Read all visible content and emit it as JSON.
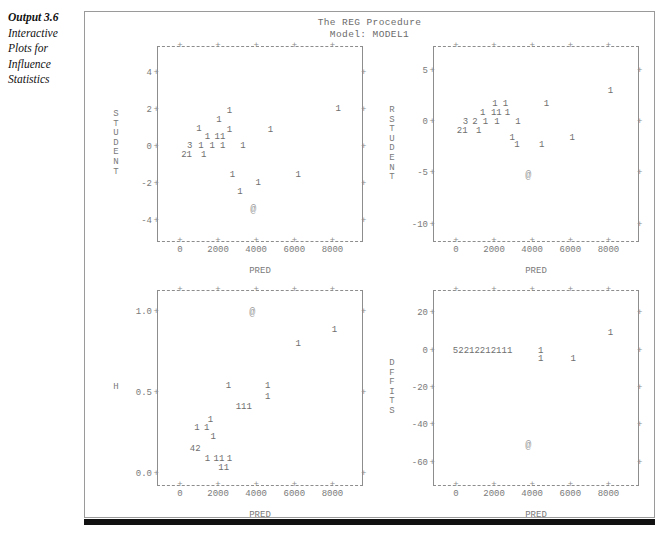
{
  "caption": {
    "strong": "Output 3.6",
    "lines": [
      "Interactive",
      "Plots for",
      "Influence",
      "Statistics"
    ]
  },
  "header": {
    "line1": "The REG Procedure",
    "line2": "Model: MODEL1"
  },
  "colors": {
    "ink": "#7a7a7a",
    "frame": "#8d8d8d",
    "rule": "#111111",
    "container_border": "#9a9a9a",
    "background": "#ffffff"
  },
  "glyphs": {
    "tick": "+",
    "marker": "@"
  },
  "chart_data": [
    {
      "type": "scatter",
      "name": "student-vs-pred",
      "title": "",
      "xlabel": "PRED",
      "ylabel": "STUDENT",
      "xlim": [
        -1200,
        9600
      ],
      "ylim": [
        -5.1,
        5.4
      ],
      "xticks": [
        0,
        2000,
        4000,
        6000,
        8000
      ],
      "yticks": [
        4,
        2,
        0,
        -2,
        -4
      ],
      "grid": false,
      "legend": "none",
      "points": [
        {
          "x": 8300,
          "y": 2.05,
          "label": "1"
        },
        {
          "x": 2600,
          "y": 1.95,
          "label": "1"
        },
        {
          "x": 2050,
          "y": 1.45,
          "label": "1"
        },
        {
          "x": 1000,
          "y": 0.95,
          "label": "1"
        },
        {
          "x": 2600,
          "y": 0.9,
          "label": "1"
        },
        {
          "x": 4750,
          "y": 0.9,
          "label": "1"
        },
        {
          "x": 1450,
          "y": 0.52,
          "label": "1"
        },
        {
          "x": 2100,
          "y": 0.52,
          "label": "11"
        },
        {
          "x": 520,
          "y": 0.03,
          "label": "3"
        },
        {
          "x": 1100,
          "y": 0.03,
          "label": "1"
        },
        {
          "x": 1700,
          "y": 0.03,
          "label": "1"
        },
        {
          "x": 2250,
          "y": 0.03,
          "label": "1"
        },
        {
          "x": 3300,
          "y": 0.03,
          "label": "1"
        },
        {
          "x": 350,
          "y": -0.42,
          "label": "21"
        },
        {
          "x": 1250,
          "y": -0.42,
          "label": "1"
        },
        {
          "x": 2750,
          "y": -1.55,
          "label": "1"
        },
        {
          "x": 6200,
          "y": -1.55,
          "label": "1"
        },
        {
          "x": 4100,
          "y": -1.95,
          "label": "1"
        },
        {
          "x": 3150,
          "y": -2.45,
          "label": "1"
        },
        {
          "x": 3850,
          "y": -3.35,
          "label": "@",
          "marker": true
        }
      ]
    },
    {
      "type": "scatter",
      "name": "rstudent-vs-pred",
      "title": "",
      "xlabel": "PRED",
      "ylabel": "RSTUDENT",
      "xlim": [
        -1200,
        9600
      ],
      "ylim": [
        -11.6,
        7.3
      ],
      "xticks": [
        0,
        2000,
        4000,
        6000,
        8000
      ],
      "yticks": [
        5,
        0,
        -5,
        -10
      ],
      "grid": false,
      "legend": "none",
      "points": [
        {
          "x": 8100,
          "y": 3.0,
          "label": "1"
        },
        {
          "x": 2050,
          "y": 1.75,
          "label": "1"
        },
        {
          "x": 2600,
          "y": 1.75,
          "label": "1"
        },
        {
          "x": 4750,
          "y": 1.75,
          "label": "1"
        },
        {
          "x": 1400,
          "y": 0.85,
          "label": "1"
        },
        {
          "x": 2120,
          "y": 0.85,
          "label": "11"
        },
        {
          "x": 2700,
          "y": 0.85,
          "label": "1"
        },
        {
          "x": 500,
          "y": 0.0,
          "label": "3"
        },
        {
          "x": 1000,
          "y": 0.0,
          "label": "2"
        },
        {
          "x": 1550,
          "y": 0.0,
          "label": "1"
        },
        {
          "x": 2150,
          "y": 0.0,
          "label": "1"
        },
        {
          "x": 3250,
          "y": 0.0,
          "label": "1"
        },
        {
          "x": 330,
          "y": -0.85,
          "label": "21"
        },
        {
          "x": 1200,
          "y": -0.85,
          "label": "1"
        },
        {
          "x": 2950,
          "y": -1.6,
          "label": "1"
        },
        {
          "x": 6100,
          "y": -1.6,
          "label": "1"
        },
        {
          "x": 3200,
          "y": -2.2,
          "label": "1"
        },
        {
          "x": 4500,
          "y": -2.2,
          "label": "1"
        },
        {
          "x": 3800,
          "y": -5.2,
          "label": "@",
          "marker": true
        }
      ]
    },
    {
      "type": "scatter",
      "name": "h-vs-pred",
      "title": "",
      "xlabel": "PRED",
      "ylabel": "H",
      "xlim": [
        -1200,
        9600
      ],
      "ylim": [
        -0.07,
        1.13
      ],
      "xticks": [
        0,
        2000,
        4000,
        6000,
        8000
      ],
      "yticks": [
        1.0,
        0.5,
        0.0
      ],
      "ytick_labels": [
        "1.0",
        "0.5",
        "0.0"
      ],
      "grid": false,
      "legend": "none",
      "points": [
        {
          "x": 3800,
          "y": 1.0,
          "label": "@",
          "marker": true
        },
        {
          "x": 8100,
          "y": 0.89,
          "label": "1"
        },
        {
          "x": 6200,
          "y": 0.8,
          "label": "1"
        },
        {
          "x": 2550,
          "y": 0.545,
          "label": "1"
        },
        {
          "x": 4600,
          "y": 0.545,
          "label": "1"
        },
        {
          "x": 4600,
          "y": 0.475,
          "label": "1"
        },
        {
          "x": 3350,
          "y": 0.415,
          "label": "111"
        },
        {
          "x": 1600,
          "y": 0.335,
          "label": "1"
        },
        {
          "x": 900,
          "y": 0.285,
          "label": "1"
        },
        {
          "x": 1400,
          "y": 0.285,
          "label": "1"
        },
        {
          "x": 1750,
          "y": 0.225,
          "label": "1"
        },
        {
          "x": 800,
          "y": 0.155,
          "label": "42"
        },
        {
          "x": 1450,
          "y": 0.09,
          "label": "1"
        },
        {
          "x": 2050,
          "y": 0.09,
          "label": "11"
        },
        {
          "x": 2600,
          "y": 0.09,
          "label": "1"
        },
        {
          "x": 2300,
          "y": 0.035,
          "label": "11"
        }
      ]
    },
    {
      "type": "scatter",
      "name": "dffits-vs-pred",
      "title": "",
      "xlabel": "PRED",
      "ylabel": "DFFITS",
      "xlim": [
        -1200,
        9600
      ],
      "ylim": [
        -72,
        32
      ],
      "xticks": [
        0,
        2000,
        4000,
        6000,
        8000
      ],
      "yticks": [
        20,
        0,
        -20,
        -40,
        -60
      ],
      "grid": false,
      "legend": "none",
      "points": [
        {
          "x": 8100,
          "y": 9.5,
          "label": "1"
        },
        {
          "x": 1400,
          "y": 0.0,
          "label": "52212212111"
        },
        {
          "x": 4450,
          "y": 0.0,
          "label": "1"
        },
        {
          "x": 4450,
          "y": -4.5,
          "label": "1"
        },
        {
          "x": 6150,
          "y": -4.5,
          "label": "1"
        },
        {
          "x": 3800,
          "y": -50.5,
          "label": "@",
          "marker": true
        }
      ]
    }
  ]
}
